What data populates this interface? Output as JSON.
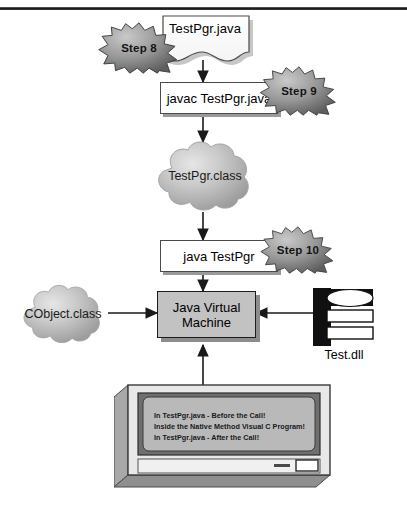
{
  "diagram": {
    "top_rule": true,
    "nodes": {
      "source_file": {
        "label": "TestPgr.java",
        "shape": "document"
      },
      "compile_cmd": {
        "label": "javac TestPgr.java",
        "shape": "box"
      },
      "class_file": {
        "label": "TestPgr.class",
        "shape": "cloud"
      },
      "run_cmd": {
        "label": "java TestPgr",
        "shape": "box"
      },
      "jvm": {
        "line1": "Java Virtual",
        "line2": "Machine",
        "shape": "box",
        "fill": "#c2c2c2"
      },
      "cobject": {
        "label": "CObject.class",
        "shape": "cloud"
      },
      "native_lib": {
        "label": "Test.dll",
        "shape": "dll-icon"
      }
    },
    "steps": [
      {
        "label": "Step 8"
      },
      {
        "label": "Step 9"
      },
      {
        "label": "Step 10"
      }
    ],
    "console": {
      "lines": [
        "In TestPgr.java - Before the Call!",
        "Inside the Native Method Visual C Program!",
        "In TestPgr.java - After the Call!"
      ]
    },
    "colors": {
      "burst_fill": "#8c8c8c",
      "cloud_fill": "#b8b8b8",
      "jvm_fill": "#c2c2c2",
      "screen_fill": "#b9b9b9",
      "line": "#1a1a1a"
    }
  }
}
